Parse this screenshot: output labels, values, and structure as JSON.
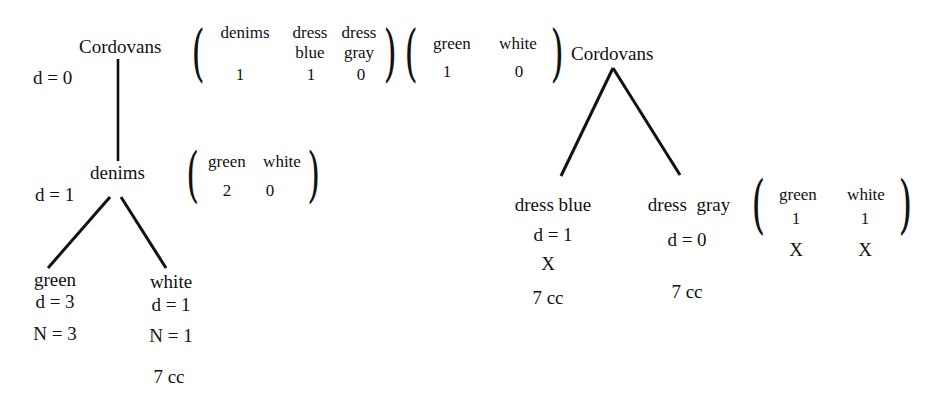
{
  "left_tree": {
    "root": {
      "label": "Cordovans",
      "depth": "d = 0",
      "matrix": {
        "columns": [
          {
            "header_top": "denims",
            "header_bottom": "",
            "value": "1"
          },
          {
            "header_top": "dress",
            "header_bottom": "blue",
            "value": "1"
          },
          {
            "header_top": "dress",
            "header_bottom": "gray",
            "value": "0"
          }
        ]
      }
    },
    "child": {
      "label": "denims",
      "depth": "d = 1",
      "matrix": {
        "columns": [
          {
            "header": "green",
            "value": "2"
          },
          {
            "header": "white",
            "value": "0"
          }
        ]
      }
    },
    "leaves": [
      {
        "label": "green",
        "depth": "d = 3",
        "n": "N = 3",
        "cost": ""
      },
      {
        "label": "white",
        "depth": "d = 1",
        "n": "N = 1",
        "cost": "7 cc"
      }
    ]
  },
  "middle_matrix": {
    "columns": [
      {
        "header": "green",
        "value": "1"
      },
      {
        "header": "white",
        "value": "0"
      }
    ]
  },
  "right_tree": {
    "root": {
      "label": "Cordovans"
    },
    "children": [
      {
        "label": "dress blue",
        "depth": "d = 1",
        "mark": "X",
        "cost": "7 cc"
      },
      {
        "label": "dress  gray",
        "depth": "d = 0",
        "mark": "",
        "cost": "7 cc"
      }
    ],
    "matrix": {
      "columns": [
        {
          "header": "green",
          "value": "1",
          "mark": "X"
        },
        {
          "header": "white",
          "value": "1",
          "mark": "X"
        }
      ]
    }
  }
}
